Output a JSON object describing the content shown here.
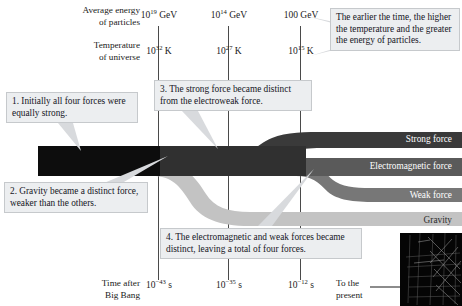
{
  "header": {
    "energy_label": "Average energy\nof particles",
    "energy_label_line1": "Average energy",
    "energy_label_line2": "of particles",
    "temp_label_line1": "Temperature",
    "temp_label_line2": "of universe",
    "energy_values": [
      "10¹⁹ GeV",
      "10¹⁴ GeV",
      "100 GeV"
    ],
    "energy_parts": [
      {
        "base": "10",
        "exp": "19",
        "unit": " GeV"
      },
      {
        "base": "10",
        "exp": "14",
        "unit": " GeV"
      },
      {
        "base": "100",
        "exp": "",
        "unit": " GeV"
      }
    ],
    "temp_parts": [
      {
        "base": "10",
        "exp": "32",
        "unit": " K"
      },
      {
        "base": "10",
        "exp": "27",
        "unit": " K"
      },
      {
        "base": "10",
        "exp": "15",
        "unit": " K"
      }
    ]
  },
  "callouts": {
    "note_top_right": "The earlier the time, the higher the temperature and the greater the energy of particles.",
    "step1": "1. Initially all four forces were equally strong.",
    "step2": "2. Gravity became a distinct force, weaker than the others.",
    "step3": "3. The strong force became distinct from the electroweak force.",
    "step4": "4. The electromagnetic and weak forces became distinct, leaving a total of four forces."
  },
  "forces": [
    {
      "name": "Strong force",
      "color": "#3a3a3a"
    },
    {
      "name": "Electromagnetic force",
      "color": "#5a5a5a"
    },
    {
      "name": "Weak force",
      "color": "#777777"
    },
    {
      "name": "Gravity",
      "color": "#c3c3c3"
    }
  ],
  "timeline": {
    "label_line1": "Time after",
    "label_line2": "Big Bang",
    "values": [
      {
        "base": "10",
        "exp": "−43",
        "unit": " s"
      },
      {
        "base": "10",
        "exp": "−35",
        "unit": " s"
      },
      {
        "base": "10",
        "exp": "−12",
        "unit": " s"
      }
    ],
    "present_line1": "To the",
    "present_line2": "present",
    "arrow": "⟶"
  },
  "colors": {
    "trunk": "#0d0d0d",
    "strong": "#3a3a3a",
    "electromagnetic": "#5a5a5a",
    "weak": "#777777",
    "gravity": "#c3c3c3",
    "callout_bg": "#eceef0",
    "gridline": "#4a4a4a"
  }
}
